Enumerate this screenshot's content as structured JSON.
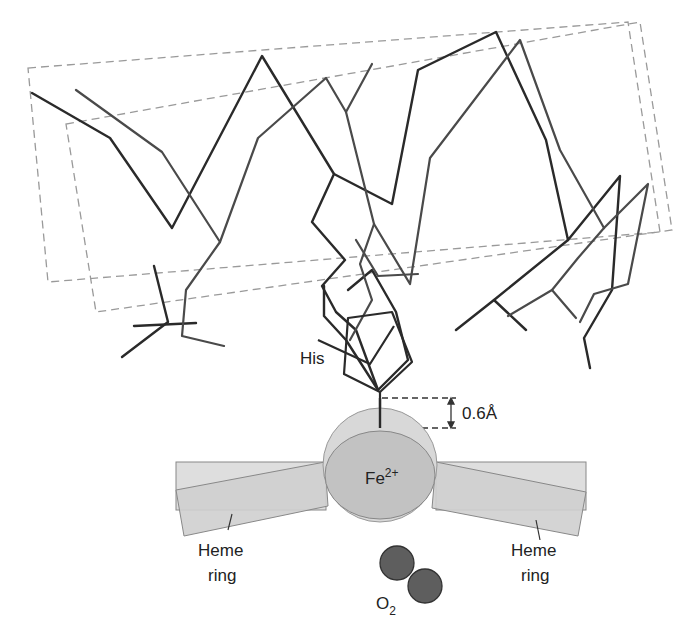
{
  "diagram": {
    "labels": {
      "his": "His",
      "distance": "0.6Å",
      "fe_base": "Fe",
      "fe_charge": "2+",
      "heme_left_line1": "Heme",
      "heme_left_line2": "ring",
      "heme_right_line1": "Heme",
      "heme_right_line2": "ring",
      "o2_base": "O",
      "o2_sub": "2"
    },
    "colors": {
      "backbone_dark": "#2b2b2b",
      "backbone_mid": "#4a4a4a",
      "dashed_box": "#999999",
      "iron_sphere": "#d6d6d6",
      "iron_inner": "#c2c2c2",
      "heme_light": "#dcdcdc",
      "heme_dark": "#c8c8c8",
      "oxygen": "#5e5e5e"
    }
  }
}
